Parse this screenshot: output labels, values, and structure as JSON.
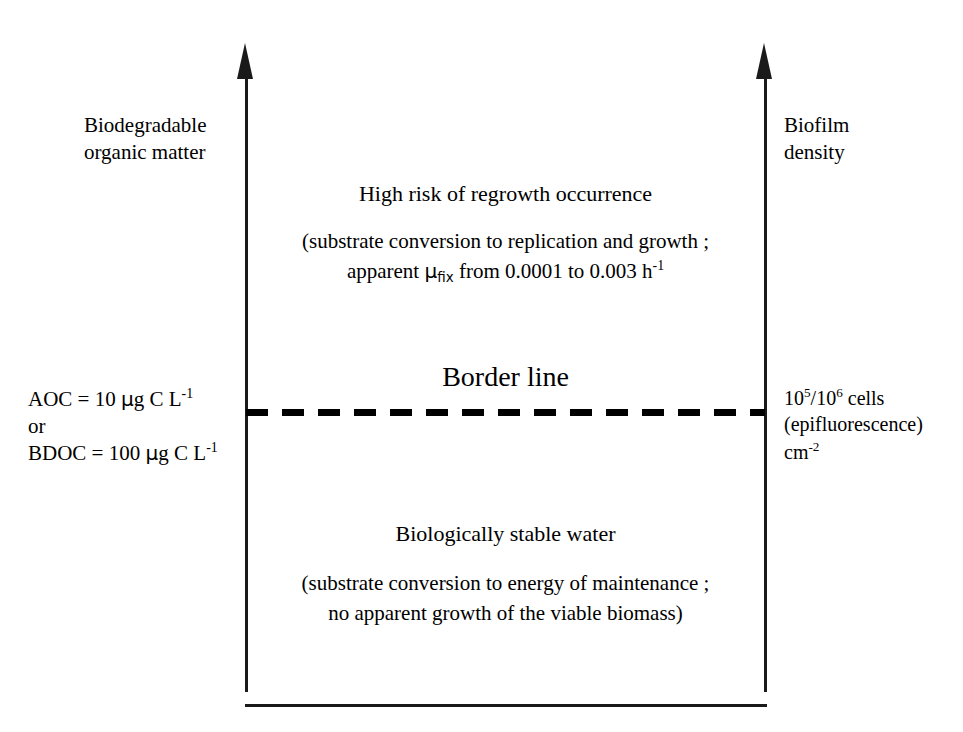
{
  "figure": {
    "type": "conceptual-threshold-diagram"
  },
  "axes": {
    "left": {
      "label_line1": "Biodegradable",
      "label_line2": "organic matter",
      "direction": "upward-arrow"
    },
    "right": {
      "label_line1": "Biofilm",
      "label_line2": "density",
      "direction": "upward-arrow"
    }
  },
  "threshold": {
    "title": "Border line",
    "style": "dashed",
    "left_values": {
      "aoc_prefix": "AOC = 10 ",
      "aoc_unit_mu": "µ",
      "aoc_unit_rest": "g C L",
      "aoc_exponent": "-1",
      "conjunction": "or",
      "bdoc_prefix": "BDOC = 100 ",
      "bdoc_unit_mu": "µ",
      "bdoc_unit_rest": "g C L",
      "bdoc_exponent": "-1"
    },
    "right_values": {
      "cells_base1": "10",
      "cells_exp1": "5",
      "cells_separator": "/10",
      "cells_exp2": "6",
      "cells_suffix": " cells",
      "method": "(epifluorescence)",
      "area_unit": "cm",
      "area_exponent": "-2"
    }
  },
  "zones": {
    "upper": {
      "heading": "High risk of regrowth occurrence",
      "detail_line1": "(substrate conversion to replication and growth ;",
      "detail_line2_pre": "apparent  ",
      "detail_line2_mu": "µ",
      "detail_line2_mu_sub": "fix",
      "detail_line2_mid": " from 0.0001 to 0.003 h",
      "detail_line2_exp": "-1"
    },
    "lower": {
      "heading": "Biologically stable water",
      "detail_line1": "(substrate conversion to energy of maintenance ;",
      "detail_line2": "no apparent growth of the viable biomass)"
    }
  },
  "colors": {
    "ink": "#1a1a1a",
    "background": "#ffffff"
  }
}
